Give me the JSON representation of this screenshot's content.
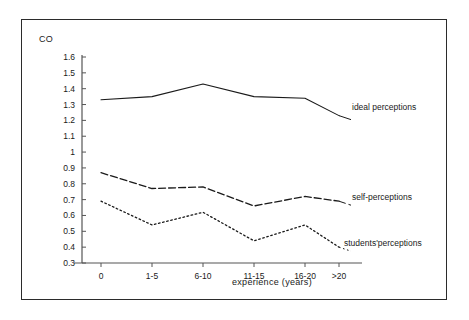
{
  "figure": {
    "y_axis_title": "CO",
    "x_axis_title": "experience (years)",
    "frame_color": "#2b2b2b",
    "line_color": "#1a1a1a",
    "background": "#ffffff"
  },
  "chart_data": {
    "type": "line",
    "title": "",
    "xlabel": "experience (years)",
    "ylabel": "CO",
    "categories": [
      "0",
      "1-5",
      "6-10",
      "11-15",
      "16-20",
      ">20"
    ],
    "ylim": [
      0.3,
      1.6
    ],
    "ytick_labels": [
      "1.6",
      "1.5",
      "1.4",
      "1.3",
      "1.2",
      "1.1",
      "1",
      "0.9",
      "0.8",
      "0.7",
      "0.6",
      "0.5",
      "0.4",
      "0.3"
    ],
    "ytick_values": [
      1.6,
      1.5,
      1.4,
      1.3,
      1.2,
      1.1,
      1.0,
      0.9,
      0.8,
      0.7,
      0.6,
      0.5,
      0.4,
      0.3
    ],
    "grid": false,
    "legend_position": "inline-right",
    "series": [
      {
        "name": "ideal perceptions",
        "style": "solid",
        "values": [
          1.33,
          1.35,
          1.43,
          1.35,
          1.34,
          1.23
        ]
      },
      {
        "name": "self-perceptions",
        "style": "dashed",
        "values": [
          0.87,
          0.77,
          0.78,
          0.66,
          0.72,
          0.69
        ]
      },
      {
        "name": "students'perceptions",
        "style": "dotted",
        "values": [
          0.69,
          0.54,
          0.62,
          0.44,
          0.54,
          0.4
        ]
      }
    ]
  }
}
